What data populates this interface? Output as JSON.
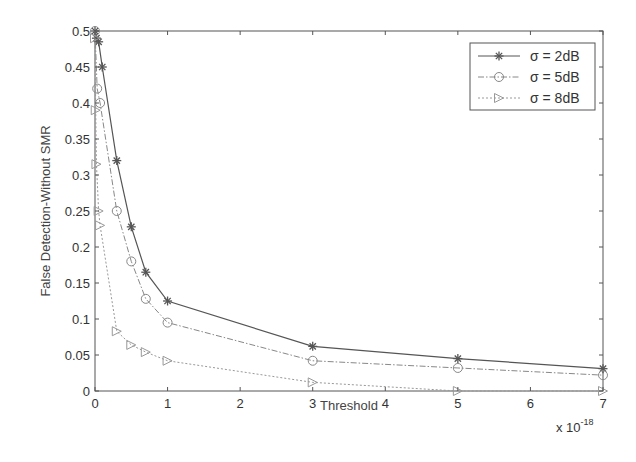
{
  "chart_data": {
    "type": "line",
    "title": "",
    "xlabel": "Threshold",
    "ylabel": "False Detection-Without SMR",
    "x_multiplier": "x 10",
    "x_multiplier_exp": "-18",
    "xlim": [
      0,
      7
    ],
    "ylim": [
      0,
      0.5
    ],
    "xticks": [
      "0",
      "1",
      "2",
      "3",
      "4",
      "5",
      "6",
      "7"
    ],
    "yticks": [
      "0",
      "0.05",
      "0.1",
      "0.15",
      "0.2",
      "0.25",
      "0.3",
      "0.35",
      "0.4",
      "0.45",
      "0.5"
    ],
    "grid": false,
    "legend_position": "upper right",
    "series": [
      {
        "name": "σ = 2dB",
        "marker": "star",
        "line_style": "solid",
        "color": "#555555",
        "x": [
          0,
          0.02,
          0.05,
          0.1,
          0.3,
          0.5,
          0.7,
          1,
          3,
          5,
          7
        ],
        "y": [
          0.5,
          0.49,
          0.485,
          0.45,
          0.32,
          0.228,
          0.165,
          0.125,
          0.062,
          0.045,
          0.031
        ]
      },
      {
        "name": "σ = 5dB",
        "marker": "circle",
        "line_style": "dashdot",
        "color": "#888888",
        "x": [
          0,
          0.03,
          0.07,
          0.3,
          0.5,
          0.7,
          1,
          3,
          5,
          7
        ],
        "y": [
          0.5,
          0.42,
          0.4,
          0.25,
          0.18,
          0.128,
          0.095,
          0.042,
          0.032,
          0.022
        ]
      },
      {
        "name": "σ = 8dB",
        "marker": "triangle-right",
        "line_style": "dotted",
        "color": "#999999",
        "x": [
          0,
          0.01,
          0.02,
          0.05,
          0.07,
          0.3,
          0.5,
          0.7,
          1,
          3,
          5,
          7
        ],
        "y": [
          0.49,
          0.39,
          0.315,
          0.25,
          0.23,
          0.083,
          0.064,
          0.054,
          0.042,
          0.012,
          0.0,
          0.0
        ]
      }
    ]
  },
  "colors": {
    "axis": "#555555",
    "background": "#ffffff",
    "text": "#333333"
  }
}
